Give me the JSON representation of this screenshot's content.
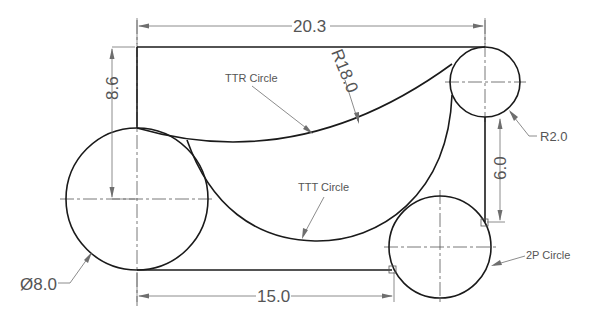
{
  "drawing": {
    "dimensions": {
      "overall_width": "20.3",
      "left_height": "8.6",
      "arc_radius": "R18.0",
      "small_radius": "R2.0",
      "right_height": "6.0",
      "large_diameter": "Ø8.0",
      "bottom_width": "15.0"
    },
    "annotations": {
      "ttr": "TTR Circle",
      "ttt": "TTT Circle",
      "two_point": "2P Circle"
    },
    "colors": {
      "geometry": "#1a1a1a",
      "dimension": "#6e6e6e",
      "background": "#ffffff"
    }
  }
}
